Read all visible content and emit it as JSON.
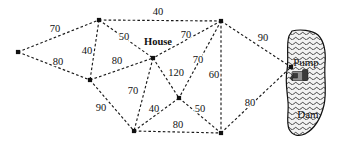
{
  "diagram": {
    "type": "weighted-network-graph",
    "line_style": "dashed",
    "colors": {
      "edge": "#1a1a1a",
      "node": "#111111",
      "label": "#111111",
      "water_fill": "#9a9a9a",
      "background": "#ffffff"
    },
    "nodes": [
      {
        "id": "n1",
        "label": "",
        "x": 18,
        "y": 52
      },
      {
        "id": "n2",
        "label": "",
        "x": 99,
        "y": 20
      },
      {
        "id": "n3",
        "label": "",
        "x": 221,
        "y": 21
      },
      {
        "id": "n4",
        "label": "House",
        "x": 153,
        "y": 58,
        "label_x": 158,
        "label_y": 43
      },
      {
        "id": "n5",
        "label": "",
        "x": 90,
        "y": 80
      },
      {
        "id": "n6",
        "label": "",
        "x": 179,
        "y": 98
      },
      {
        "id": "n7",
        "label": "",
        "x": 134,
        "y": 131
      },
      {
        "id": "n8",
        "label": "",
        "x": 221,
        "y": 133
      },
      {
        "id": "n9",
        "label": "Pump",
        "x": 291,
        "y": 67,
        "label_x": 306,
        "label_y": 63
      }
    ],
    "edges": [
      {
        "from": "n1",
        "to": "n2",
        "weight": "70",
        "label_x": 55,
        "label_y": 30
      },
      {
        "from": "n1",
        "to": "n5",
        "weight": "80",
        "label_x": 58,
        "label_y": 63
      },
      {
        "from": "n2",
        "to": "n5",
        "weight": "40",
        "label_x": 87,
        "label_y": 52
      },
      {
        "from": "n2",
        "to": "n3",
        "weight": "40",
        "label_x": 158,
        "label_y": 13
      },
      {
        "from": "n2",
        "to": "n4",
        "weight": "50",
        "label_x": 124,
        "label_y": 38
      },
      {
        "from": "n5",
        "to": "n4",
        "weight": "80",
        "label_x": 117,
        "label_y": 62
      },
      {
        "from": "n3",
        "to": "n4",
        "weight": "70",
        "label_x": 186,
        "label_y": 36
      },
      {
        "from": "n3",
        "to": "n6",
        "weight": "70",
        "label_x": 198,
        "label_y": 61
      },
      {
        "from": "n3",
        "to": "n8",
        "weight": "60",
        "label_x": 214,
        "label_y": 76
      },
      {
        "from": "n3",
        "to": "n9",
        "weight": "90",
        "label_x": 263,
        "label_y": 39
      },
      {
        "from": "n4",
        "to": "n6",
        "weight": "120",
        "label_x": 176,
        "label_y": 74
      },
      {
        "from": "n4",
        "to": "n7",
        "weight": "70",
        "label_x": 133,
        "label_y": 92
      },
      {
        "from": "n5",
        "to": "n7",
        "weight": "90",
        "label_x": 101,
        "label_y": 109
      },
      {
        "from": "n7",
        "to": "n6",
        "weight": "40",
        "label_x": 154,
        "label_y": 110
      },
      {
        "from": "n6",
        "to": "n8",
        "weight": "50",
        "label_x": 200,
        "label_y": 110
      },
      {
        "from": "n7",
        "to": "n8",
        "weight": "80",
        "label_x": 178,
        "label_y": 126
      },
      {
        "from": "n8",
        "to": "n9",
        "weight": "80",
        "label_x": 250,
        "label_y": 104
      }
    ],
    "water_body": {
      "name": "Dam",
      "label": "Dam",
      "label_x": 308,
      "label_y": 115,
      "pump_label": "Pump",
      "pump_icon": "pump-machine-icon"
    }
  }
}
